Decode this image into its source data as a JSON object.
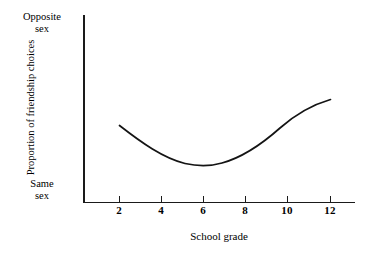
{
  "chart_data": {
    "type": "line",
    "title": "",
    "xlabel": "School grade",
    "ylabel": "Proportion of friendship choices",
    "x": [
      2,
      4,
      6,
      8,
      10,
      12
    ],
    "xticklabels": [
      "2",
      "4",
      "6",
      "8",
      "10",
      "12"
    ],
    "xlim": [
      1,
      13.5
    ],
    "ylim": [
      0,
      1
    ],
    "yticklabels": [
      "Opposite sex",
      "Same sex"
    ],
    "y_axis_top_label": "Opposite\nsex",
    "y_axis_bottom_label": "Same\nsex",
    "grid": false,
    "legend": "none",
    "series": [
      {
        "name": "Proportion of friendship choices",
        "x": [
          2,
          3,
          4,
          5,
          6,
          7,
          8,
          9,
          10,
          11,
          12
        ],
        "values": [
          0.41,
          0.34,
          0.28,
          0.23,
          0.21,
          0.22,
          0.26,
          0.33,
          0.42,
          0.52,
          0.56
        ]
      }
    ],
    "annotations": []
  },
  "axis": {
    "top_label_line1": "Opposite",
    "top_label_line2": "sex",
    "bottom_label_line1": "Same",
    "bottom_label_line2": "sex",
    "y_title": "Proportion of friendship choices",
    "x_title": "School grade"
  },
  "ticks": [
    {
      "label": "2",
      "x": 119
    },
    {
      "label": "4",
      "x": 161
    },
    {
      "label": "6",
      "x": 203
    },
    {
      "label": "8",
      "x": 245
    },
    {
      "label": "10",
      "x": 287
    },
    {
      "label": "12",
      "x": 330
    }
  ],
  "curve": {
    "path": "M 119.5 125.5 C 142 143 163 158 185 163.5 C 196 166 210 166.5 222 163 C 244 157 262 144 280 128 C 297 113 315 104 330.5 99.5",
    "color": "#141414"
  },
  "colors": {
    "background": "#ffffff",
    "axis": "#1a1a1a",
    "curve": "#141414",
    "text": "#000000"
  }
}
